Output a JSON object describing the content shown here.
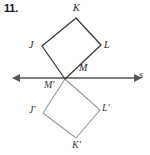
{
  "problem": {
    "number": "11."
  },
  "figure": {
    "type": "reflection-diagram",
    "colors": {
      "preimage_stroke": "#3b3b3b",
      "image_stroke": "#9a9a9a",
      "line_stroke": "#555555",
      "label_text": "#1a1a1a",
      "background": "#ffffff"
    },
    "line_of_reflection": {
      "name": "s",
      "label_x": 139,
      "label_y": 70,
      "x1": 20,
      "y1": 78,
      "x2": 134,
      "y2": 78,
      "arrows": "both"
    },
    "preimage": {
      "name": "JKLM",
      "points": "42,46 76,18 101,45 65,79",
      "vertices": [
        {
          "label": "K",
          "px": 73,
          "py": 3,
          "vx": 76,
          "vy": 18
        },
        {
          "label": "J",
          "px": 29,
          "py": 40,
          "vx": 42,
          "vy": 46
        },
        {
          "label": "L",
          "px": 104,
          "py": 40,
          "vx": 101,
          "vy": 45
        },
        {
          "label": "M",
          "px": 79,
          "py": 63,
          "vx": 65,
          "vy": 79
        }
      ]
    },
    "image": {
      "name": "J'K'L'M'",
      "points": "43,113 76,138 100,110 65,79",
      "vertices": [
        {
          "label": "K'",
          "px": 72,
          "py": 140,
          "vx": 76,
          "vy": 138
        },
        {
          "label": "J'",
          "px": 29,
          "py": 105,
          "vx": 43,
          "vy": 113
        },
        {
          "label": "L'",
          "px": 102,
          "py": 103,
          "vx": 100,
          "vy": 110
        },
        {
          "label": "M'",
          "px": 44,
          "py": 80,
          "vx": 65,
          "vy": 79
        }
      ]
    }
  }
}
